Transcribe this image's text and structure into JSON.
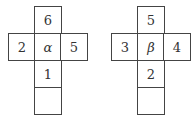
{
  "figures": [
    {
      "name": "net-alpha",
      "cells": {
        "top": "6",
        "left": "2",
        "center": "α",
        "right": "5",
        "below": "1",
        "bottom": ""
      }
    },
    {
      "name": "net-beta",
      "cells": {
        "top": "5",
        "left": "3",
        "center": "β",
        "right": "4",
        "below": "2",
        "bottom": ""
      }
    }
  ]
}
